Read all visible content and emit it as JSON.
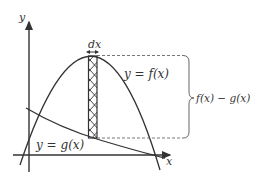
{
  "diagram": {
    "axes": {
      "x_label": "x",
      "y_label": "y"
    },
    "curves": {
      "f_label": "y = f(x)",
      "g_label": "y = g(x)"
    },
    "strip": {
      "width_label": "dx"
    },
    "brace_label": "f(x) − g(x)",
    "colors": {
      "stroke": "#333333",
      "dashed": "#555555"
    }
  }
}
